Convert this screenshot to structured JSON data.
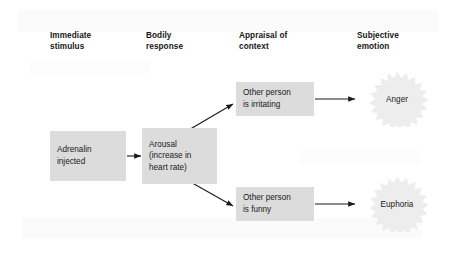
{
  "figure": {
    "type": "flow-diagram",
    "background_color": "#ffffff",
    "box_fill_color": "#dcdcdc",
    "burst_fill_color": "#ededed",
    "text_color": "#1a1a1a",
    "arrow_color": "#1a1a1a"
  },
  "columns": [
    {
      "id": "immediate-stimulus",
      "label": "Immediate\nstimulus"
    },
    {
      "id": "bodily-response",
      "label": "Bodily\nresponse"
    },
    {
      "id": "appraisal-of-context",
      "label": "Appraisal of\ncontext"
    },
    {
      "id": "subjective-emotion",
      "label": "Subjective\nemotion"
    }
  ],
  "nodes": {
    "adrenalin": {
      "label": "Adrenalin\ninjected",
      "shape": "rectangle"
    },
    "arousal": {
      "label": "Arousal\n(increase in\nheart rate)",
      "shape": "rectangle"
    },
    "appraisal_irritating": {
      "label": "Other person\nis irritating",
      "shape": "rectangle"
    },
    "appraisal_funny": {
      "label": "Other person\nis funny",
      "shape": "rectangle"
    },
    "emotion_anger": {
      "label": "Anger",
      "shape": "starburst"
    },
    "emotion_euphoria": {
      "label": "Euphoria",
      "shape": "starburst"
    }
  },
  "edges": [
    {
      "id": "adrenalin-to-arousal",
      "from": "adrenalin",
      "to": "arousal",
      "style": "straight-arrow"
    },
    {
      "id": "arousal-to-irritating",
      "from": "arousal",
      "to": "appraisal_irritating",
      "style": "diagonal-arrow-up"
    },
    {
      "id": "arousal-to-funny",
      "from": "arousal",
      "to": "appraisal_funny",
      "style": "diagonal-arrow-down"
    },
    {
      "id": "irritating-to-anger",
      "from": "appraisal_irritating",
      "to": "emotion_anger",
      "style": "straight-arrow"
    },
    {
      "id": "funny-to-euphoria",
      "from": "appraisal_funny",
      "to": "emotion_euphoria",
      "style": "straight-arrow"
    }
  ]
}
